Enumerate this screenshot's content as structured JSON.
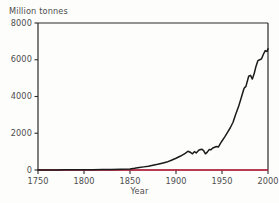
{
  "chart_data": {
    "type": "line",
    "title": "",
    "subtitle": "",
    "xlabel": "Year",
    "ylabel": "Million tonnes",
    "xlim": [
      1750,
      2000
    ],
    "ylim": [
      0,
      8000
    ],
    "grid": false,
    "legend": null,
    "xticks": [
      1750,
      1800,
      1850,
      1900,
      1950,
      2000
    ],
    "xtick_labels": [
      "1750",
      "1800",
      "1850",
      "1900",
      "1950",
      "2000"
    ],
    "yticks": [
      0,
      2000,
      4000,
      6000,
      8000
    ],
    "ytick_labels": [
      "0",
      "2000",
      "4000",
      "6000",
      "8000"
    ],
    "series": [
      {
        "name": "Global carbon emissions",
        "color": "#1b1b1b",
        "x": [
          1750,
          1760,
          1770,
          1780,
          1790,
          1800,
          1810,
          1820,
          1830,
          1840,
          1850,
          1855,
          1860,
          1865,
          1870,
          1875,
          1880,
          1885,
          1890,
          1895,
          1900,
          1905,
          1910,
          1913,
          1916,
          1918,
          1920,
          1922,
          1925,
          1928,
          1930,
          1932,
          1934,
          1936,
          1938,
          1940,
          1942,
          1944,
          1946,
          1948,
          1950,
          1953,
          1956,
          1959,
          1962,
          1965,
          1968,
          1971,
          1974,
          1976,
          1979,
          1981,
          1983,
          1985,
          1987,
          1989,
          1991,
          1993,
          1995,
          1997,
          1999,
          2000
        ],
        "y": [
          3,
          4,
          5,
          7,
          9,
          12,
          16,
          22,
          30,
          45,
          60,
          90,
          130,
          170,
          210,
          260,
          310,
          370,
          430,
          530,
          640,
          760,
          900,
          1020,
          950,
          880,
          1000,
          930,
          1090,
          1130,
          1060,
          880,
          970,
          1110,
          1100,
          1200,
          1240,
          1280,
          1250,
          1420,
          1580,
          1800,
          2050,
          2300,
          2600,
          3050,
          3450,
          3950,
          4450,
          4550,
          5100,
          5150,
          4950,
          5250,
          5650,
          5950,
          6000,
          6050,
          6300,
          6500,
          6450,
          6600
        ]
      },
      {
        "name": "baseline",
        "color": "#c2203c",
        "x": [
          1750,
          2000
        ],
        "y": [
          0,
          0
        ]
      }
    ]
  },
  "axes": {
    "y_caption": "Million tonnes",
    "x_caption": "Year",
    "frame_color": "#2b2b2b",
    "baseline_color": "#c2203c",
    "curve_color": "#1b1b1b"
  }
}
